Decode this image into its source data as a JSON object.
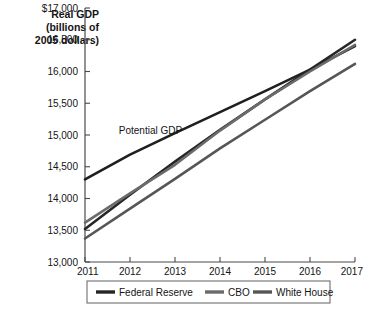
{
  "chart_data": {
    "type": "line",
    "title": "",
    "ylabel": "Real GDP (billions of 2005 dollars)",
    "ylabel_lines": [
      "Real GDP",
      "(billions of",
      "2005 dollars)"
    ],
    "xlabel": "",
    "x": [
      2011,
      2012,
      2013,
      2014,
      2015,
      2016,
      2017
    ],
    "xtick_labels": [
      "2011",
      "2012",
      "2013",
      "2014",
      "2015",
      "2016",
      "2017"
    ],
    "ytick_labels": [
      "$17,000",
      "16,500",
      "16,000",
      "15,500",
      "15,000",
      "14,500",
      "14,000",
      "13,500",
      "13,000"
    ],
    "ytick_values": [
      17000,
      16500,
      16000,
      15500,
      15000,
      14500,
      14000,
      13500,
      13000
    ],
    "ylim": [
      13000,
      17000
    ],
    "xlim": [
      2011,
      2017
    ],
    "grid": false,
    "legend_position": "below",
    "annotations": [
      {
        "text": "Potential GDP",
        "x": 2011.75,
        "y": 15020
      }
    ],
    "series": [
      {
        "name": "Potential GDP",
        "color": "#1f1f1f",
        "width": 2.6,
        "in_legend": false,
        "values": [
          14300,
          14690,
          15030,
          15360,
          15690,
          16030,
          16400
        ]
      },
      {
        "name": "Federal Reserve",
        "color": "#262626",
        "width": 2.6,
        "in_legend": true,
        "values": [
          13520,
          14060,
          14580,
          15080,
          15560,
          16030,
          16500
        ]
      },
      {
        "name": "CBO",
        "color": "#6b6b6b",
        "width": 2.6,
        "in_legend": true,
        "values": [
          13620,
          14080,
          14530,
          15070,
          15560,
          16000,
          16420
        ]
      },
      {
        "name": "White House",
        "color": "#565656",
        "width": 2.6,
        "in_legend": true,
        "values": [
          13370,
          13840,
          14310,
          14790,
          15240,
          15690,
          16120
        ]
      }
    ]
  },
  "legend": {
    "items": [
      {
        "label": "Federal Reserve",
        "color": "#262626"
      },
      {
        "label": "CBO",
        "color": "#6b6b6b"
      },
      {
        "label": "White House",
        "color": "#565656"
      }
    ]
  },
  "colors": {
    "axis": "#4a4a4a",
    "text": "#141414",
    "legend_border": "#6e6e6e",
    "background": "#ffffff"
  }
}
